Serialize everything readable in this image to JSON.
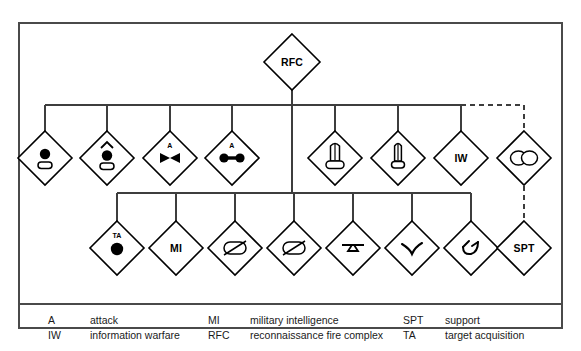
{
  "diagram": {
    "line_color": "#3d3d3d",
    "symbol_color": "#000000",
    "root": {
      "id": "rfc",
      "label": "RFC",
      "name": "rfc-node",
      "cx": 292,
      "cy": 62,
      "r": 28
    },
    "row1": [
      {
        "id": "r1-1",
        "label": "",
        "symbol": "circle-over-rounded-rect",
        "name": "unit-node-recon",
        "cx": 45,
        "cy": 158,
        "r": 27
      },
      {
        "id": "r1-2",
        "label": "",
        "symbol": "chevron-circle-over-rounded-rect",
        "name": "unit-node-recon-air",
        "cx": 107,
        "cy": 158,
        "r": 27
      },
      {
        "id": "r1-3",
        "label": "A",
        "symbol": "bowtie",
        "name": "unit-node-attack-bowtie",
        "cx": 170,
        "cy": 158,
        "r": 27
      },
      {
        "id": "r1-4",
        "label": "A",
        "symbol": "dumbbell",
        "name": "unit-node-attack-dumbbell",
        "cx": 232,
        "cy": 158,
        "r": 27
      },
      {
        "id": "r1-5",
        "label": "",
        "symbol": "missile-wide",
        "name": "unit-node-missile-wide",
        "cx": 335,
        "cy": 158,
        "r": 27
      },
      {
        "id": "r1-6",
        "label": "",
        "symbol": "missile-narrow",
        "name": "unit-node-missile-narrow",
        "cx": 398,
        "cy": 158,
        "r": 27
      },
      {
        "id": "r1-7",
        "label": "IW",
        "symbol": "text",
        "name": "unit-node-iw",
        "cx": 461,
        "cy": 158,
        "r": 27
      },
      {
        "id": "r1-8",
        "label": "",
        "symbol": "double-ellipse-crossed",
        "name": "unit-node-attached",
        "cx": 524,
        "cy": 158,
        "r": 27
      }
    ],
    "row2": [
      {
        "id": "r2-1",
        "label": "TA",
        "symbol": "filled-circle",
        "name": "unit-node-target-acquisition",
        "cx": 117,
        "cy": 248,
        "r": 27
      },
      {
        "id": "r2-2",
        "label": "MI",
        "symbol": "text",
        "name": "unit-node-mi",
        "cx": 176,
        "cy": 248,
        "r": 27
      },
      {
        "id": "r2-3",
        "label": "",
        "symbol": "oval-slash",
        "name": "unit-node-oval-slash-a",
        "cx": 235,
        "cy": 248,
        "r": 27
      },
      {
        "id": "r2-4",
        "label": "",
        "symbol": "oval-slash",
        "name": "unit-node-oval-slash-b",
        "cx": 294,
        "cy": 248,
        "r": 27
      },
      {
        "id": "r2-5",
        "label": "",
        "symbol": "lightning",
        "name": "unit-node-signal",
        "cx": 353,
        "cy": 248,
        "r": 27
      },
      {
        "id": "r2-6",
        "label": "",
        "symbol": "check-v",
        "name": "unit-node-check",
        "cx": 412,
        "cy": 248,
        "r": 27
      },
      {
        "id": "r2-7",
        "label": "",
        "symbol": "hook-flag",
        "name": "unit-node-hook",
        "cx": 471,
        "cy": 248,
        "r": 27
      },
      {
        "id": "r2-8",
        "label": "SPT",
        "symbol": "text",
        "name": "unit-node-spt",
        "cx": 524,
        "cy": 248,
        "r": 27
      }
    ],
    "connectors": {
      "bus1_y": 105,
      "bus1_x_start": 45,
      "bus1_x_solid_end": 461,
      "bus1_dashed_end": 524,
      "bus2_y": 193,
      "bus2_x_start": 117,
      "bus2_x_end": 471,
      "trunk_x": 292,
      "trunk_top": 90,
      "trunk_bottom": 193
    }
  },
  "legend": {
    "columns": [
      {
        "name": "legend-column-1",
        "entries": [
          {
            "abbr": "A",
            "text": "attack"
          },
          {
            "abbr": "IW",
            "text": "information warfare"
          }
        ]
      },
      {
        "name": "legend-column-2",
        "entries": [
          {
            "abbr": "MI",
            "text": "military intelligence"
          },
          {
            "abbr": "RFC",
            "text": "reconnaissance fire complex"
          }
        ]
      },
      {
        "name": "legend-column-3",
        "entries": [
          {
            "abbr": "SPT",
            "text": "support"
          },
          {
            "abbr": "TA",
            "text": "target acquisition"
          }
        ]
      }
    ]
  }
}
